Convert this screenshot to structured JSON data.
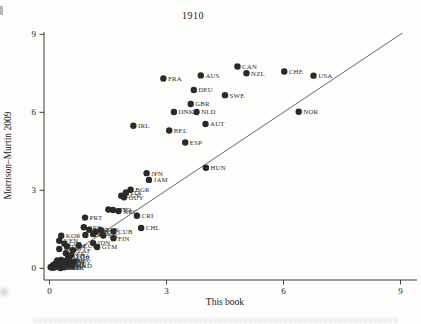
{
  "figure": {
    "title": "1910",
    "x_axis": {
      "label": "This book",
      "ticks": [
        0,
        3,
        6,
        9
      ]
    },
    "y_axis": {
      "label": "Morrison–Murtin 2009",
      "ticks": [
        0,
        3,
        6,
        9
      ]
    }
  },
  "chart_data": {
    "type": "scatter",
    "title": "1910",
    "xlabel": "This book",
    "ylabel": "Morrison–Murtin 2009",
    "xlim": [
      0,
      9
    ],
    "ylim": [
      0,
      9
    ],
    "x_ticks": [
      0,
      3,
      6,
      9
    ],
    "y_ticks": [
      0,
      3,
      6,
      9
    ],
    "grid": false,
    "marker_color": "#2a2a2a",
    "label_color": "#2e2e2e",
    "axis_color": "#3c3c3c",
    "reference_line": {
      "type": "y=x",
      "from": [
        0.33,
        0.33
      ],
      "to": [
        9.05,
        9.05
      ],
      "color": "#555555"
    },
    "points": [
      {
        "label": "CAN",
        "x": 4.82,
        "y": 7.76
      },
      {
        "label": "NZL",
        "x": 5.05,
        "y": 7.5
      },
      {
        "label": "CHE",
        "x": 6.02,
        "y": 7.57
      },
      {
        "label": "USA",
        "x": 6.77,
        "y": 7.41
      },
      {
        "label": "AUS",
        "x": 3.88,
        "y": 7.42
      },
      {
        "label": "FRA",
        "x": 2.92,
        "y": 7.3
      },
      {
        "label": "DEU",
        "x": 3.7,
        "y": 6.86
      },
      {
        "label": "SWE",
        "x": 4.5,
        "y": 6.66
      },
      {
        "label": "GBR",
        "x": 3.62,
        "y": 6.32
      },
      {
        "label": "DNK",
        "x": 3.19,
        "y": 6.01
      },
      {
        "label": "NLD",
        "x": 3.77,
        "y": 6.01
      },
      {
        "label": "NOR",
        "x": 6.39,
        "y": 6.02
      },
      {
        "label": "AUT",
        "x": 4.0,
        "y": 5.55
      },
      {
        "label": "IRL",
        "x": 2.15,
        "y": 5.48
      },
      {
        "label": "BEL",
        "x": 3.07,
        "y": 5.3
      },
      {
        "label": "ESP",
        "x": 3.48,
        "y": 4.84
      },
      {
        "label": "HUN",
        "x": 4.01,
        "y": 3.87
      },
      {
        "label": "JPN",
        "x": 2.49,
        "y": 3.66
      },
      {
        "label": "JAM",
        "x": 2.55,
        "y": 3.4
      },
      {
        "label": "BGR",
        "x": 2.08,
        "y": 3.02
      },
      {
        "label": "ITA",
        "x": 1.96,
        "y": 2.92
      },
      {
        "label": "EGY",
        "x": 1.84,
        "y": 2.79
      },
      {
        "label": "GUY",
        "x": 1.91,
        "y": 2.73
      },
      {
        "label": "URY",
        "x": 1.51,
        "y": 2.26
      },
      {
        "label": "TTO",
        "x": 1.63,
        "y": 2.24
      },
      {
        "label": "ARG",
        "x": 1.77,
        "y": 2.2
      },
      {
        "label": "PRT",
        "x": 0.91,
        "y": 1.95
      },
      {
        "label": "CRI",
        "x": 2.24,
        "y": 2.02
      },
      {
        "label": "CHL",
        "x": 2.35,
        "y": 1.55
      },
      {
        "label": "SRB",
        "x": 0.88,
        "y": 1.58
      },
      {
        "label": "GRC",
        "x": 1.02,
        "y": 1.48
      },
      {
        "label": "MEX",
        "x": 1.18,
        "y": 1.4
      },
      {
        "label": "PAN",
        "x": 1.32,
        "y": 1.47
      },
      {
        "label": "PHL",
        "x": 1.12,
        "y": 1.32
      },
      {
        "label": "PER",
        "x": 0.92,
        "y": 1.28
      },
      {
        "label": "NIC",
        "x": 1.38,
        "y": 1.26
      },
      {
        "label": "CUB",
        "x": 1.64,
        "y": 1.42
      },
      {
        "label": "FIN",
        "x": 1.64,
        "y": 1.16
      },
      {
        "label": "IDN",
        "x": 1.12,
        "y": 0.97
      },
      {
        "label": "GTM",
        "x": 1.22,
        "y": 0.82
      },
      {
        "label": "ECU",
        "x": 0.75,
        "y": 0.88
      },
      {
        "label": "KOR",
        "x": 0.3,
        "y": 1.25
      },
      {
        "label": "VEN",
        "x": 0.25,
        "y": 1.06
      },
      {
        "label": "COL",
        "x": 0.38,
        "y": 0.95
      },
      {
        "label": "LKA",
        "x": 0.45,
        "y": 0.84
      },
      {
        "label": "BRA",
        "x": 0.25,
        "y": 0.74
      },
      {
        "label": "ZAF",
        "x": 0.6,
        "y": 0.7
      },
      {
        "label": "DZA",
        "x": 0.42,
        "y": 0.58
      },
      {
        "label": "THA",
        "x": 0.55,
        "y": 0.5
      },
      {
        "label": "MMR",
        "x": 0.48,
        "y": 0.42
      },
      {
        "label": "TUR",
        "x": 0.3,
        "y": 0.32
      },
      {
        "label": "VNM",
        "x": 0.2,
        "y": 0.3
      },
      {
        "label": "HTI",
        "x": 0.52,
        "y": 0.28
      },
      {
        "label": "DOM",
        "x": 0.36,
        "y": 0.27
      },
      {
        "label": "SLV",
        "x": 0.62,
        "y": 0.24
      },
      {
        "label": "CHN",
        "x": 0.16,
        "y": 0.2
      },
      {
        "label": "BOL",
        "x": 0.45,
        "y": 0.18
      },
      {
        "label": "KEN",
        "x": 0.26,
        "y": 0.16
      },
      {
        "label": "GHA",
        "x": 0.42,
        "y": 0.12
      },
      {
        "label": "IND",
        "x": 0.1,
        "y": 0.13
      },
      {
        "label": "IRN",
        "x": 0.22,
        "y": 0.1
      },
      {
        "label": "HND",
        "x": 0.58,
        "y": 0.1
      },
      {
        "label": "IRQ",
        "x": 0.32,
        "y": 0.07
      },
      {
        "label": "PAK",
        "x": 0.06,
        "y": 0.07
      },
      {
        "label": "NGA",
        "x": 0.38,
        "y": 0.04
      },
      {
        "label": "MAR",
        "x": 0.14,
        "y": 0.04
      },
      {
        "label": "ETH",
        "x": 0.03,
        "y": 0.04
      },
      {
        "label": "SEN",
        "x": 0.08,
        "y": 0.02
      },
      {
        "label": "KHM",
        "x": 0.28,
        "y": 0.01
      }
    ]
  }
}
